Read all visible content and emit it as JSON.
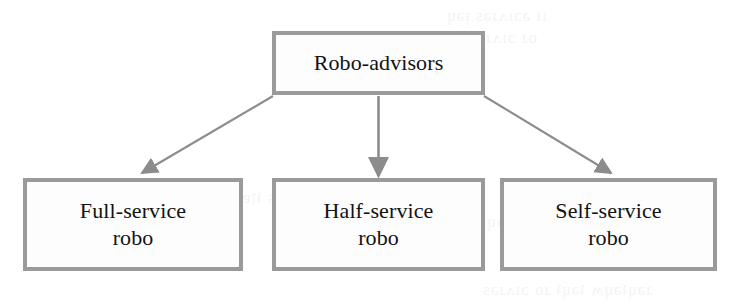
{
  "diagram": {
    "orientation": "top-down tree",
    "style": {
      "box_border_color": "#9a9a9a",
      "box_fill_color": "#fdfdfd",
      "text_color": "#121212",
      "connector_color": "#8c8c8c",
      "background_color": "#ffffff"
    },
    "root": {
      "id": "robo-advisors",
      "label": "Robo-advisors"
    },
    "children": [
      {
        "id": "full-service-robo",
        "label_line_1": "Full-service",
        "label_line_2": "robo"
      },
      {
        "id": "half-service-robo",
        "label_line_1": "Half-service",
        "label_line_2": "robo"
      },
      {
        "id": "self-service-robo",
        "label_line_1": "Self-service",
        "label_line_2": "robo"
      }
    ],
    "connectors": [
      {
        "id": "root-to-full",
        "from": "robo-advisors",
        "to": "full-service-robo",
        "arrow": "down-left"
      },
      {
        "id": "root-to-half",
        "from": "robo-advisors",
        "to": "half-service-robo",
        "arrow": "down"
      },
      {
        "id": "root-to-self",
        "from": "robo-advisors",
        "to": "self-service-robo",
        "arrow": "down-right"
      }
    ]
  },
  "bleed_through": {
    "line_1": "ıı əɔıʌɹǝs ᴉǝɥ",
    "line_2": "oɹ ɔıʌɹǝs-ɟןɐH",
    "line_3": "ɔıʌɹǝs ןןᴉ ɐ ɹǝɥʇǝɥʍ",
    "line_4": "ɹǝɥʇǝɥʍ ʇǝɥʇ ɹo ɔıʌɹǝs",
    "line_5": "əɔıʌɹǝs ʇןɐɥ ɐ ɹo"
  }
}
